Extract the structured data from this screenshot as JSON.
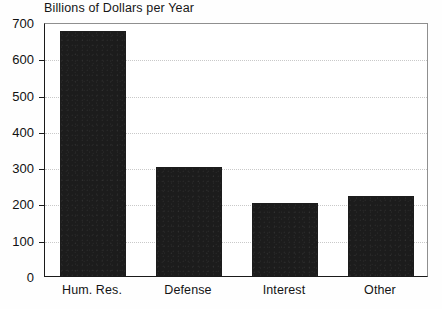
{
  "chart_data": {
    "type": "bar",
    "title": "Billions of Dollars per Year",
    "xlabel": "",
    "ylabel": "",
    "categories": [
      "Hum. Res.",
      "Defense",
      "Interest",
      "Other"
    ],
    "values": [
      675,
      300,
      200,
      220
    ],
    "ylim": [
      0,
      700
    ],
    "ytick_labels": [
      "0",
      "100",
      "200",
      "300",
      "400",
      "500",
      "600",
      "700"
    ],
    "ytick_values": [
      0,
      100,
      200,
      300,
      400,
      500,
      600,
      700
    ],
    "grid": "horizontal-dotted",
    "legend": "none",
    "bar_color": "#1c1c1c",
    "grid_color": "#c9c9c9",
    "axis_color": "#1a1a1a",
    "background_color": "#ffffff"
  }
}
